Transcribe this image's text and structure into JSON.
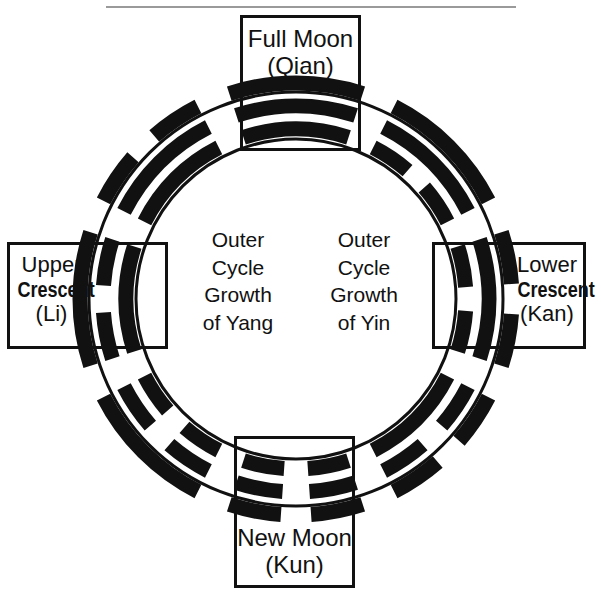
{
  "diagram": {
    "title_boxes": {
      "full_moon": {
        "line1": "Full Moon",
        "line2": "(Qian)"
      },
      "new_moon": {
        "line1": "New Moon",
        "line2": "(Kun)"
      },
      "upper_crescent": {
        "line1": "Upper",
        "line2": "Crescent",
        "line3": "(Li)"
      },
      "lower_crescent": {
        "line1": "Lower",
        "line2": "Crescent",
        "line3": "(Kan)"
      }
    },
    "center_legends": {
      "left": {
        "line1": "Outer",
        "line2": "Cycle",
        "line3": "Growth",
        "line4": "of Yang"
      },
      "right": {
        "line1": "Outer",
        "line2": "Cycle",
        "line3": "Growth",
        "line4": "of Yin"
      }
    },
    "geometry": {
      "center_x": 296,
      "center_y": 299,
      "outer_radius": 207,
      "inner_radius": 160,
      "ring_stroke": 3,
      "bar_color": "#111111",
      "rule_color": "#9a9a9a",
      "background": "#ffffff"
    },
    "trigrams": [
      {
        "name": "qian",
        "label": "Full Moon (Qian)",
        "angle_deg": 270,
        "position": "top",
        "lines_outer_to_inner": [
          "solid",
          "solid",
          "solid"
        ]
      },
      {
        "name": "xun",
        "label": "",
        "angle_deg": 315,
        "position": "upper-right",
        "lines_outer_to_inner": [
          "solid",
          "solid",
          "broken"
        ]
      },
      {
        "name": "kan",
        "label": "Lower Crescent (Kan)",
        "angle_deg": 0,
        "position": "right",
        "lines_outer_to_inner": [
          "broken",
          "solid",
          "broken"
        ]
      },
      {
        "name": "gen",
        "label": "",
        "angle_deg": 45,
        "position": "lower-right",
        "lines_outer_to_inner": [
          "broken",
          "broken",
          "solid"
        ]
      },
      {
        "name": "kun",
        "label": "New Moon (Kun)",
        "angle_deg": 90,
        "position": "bottom",
        "lines_outer_to_inner": [
          "broken",
          "broken",
          "broken"
        ]
      },
      {
        "name": "zhen",
        "label": "",
        "angle_deg": 135,
        "position": "lower-left",
        "lines_outer_to_inner": [
          "solid",
          "broken",
          "broken"
        ]
      },
      {
        "name": "li",
        "label": "Upper Crescent (Li)",
        "angle_deg": 180,
        "position": "left",
        "lines_outer_to_inner": [
          "solid",
          "broken",
          "solid"
        ]
      },
      {
        "name": "dui",
        "label": "",
        "angle_deg": 225,
        "position": "upper-left",
        "lines_outer_to_inner": [
          "broken",
          "solid",
          "solid"
        ]
      }
    ]
  }
}
